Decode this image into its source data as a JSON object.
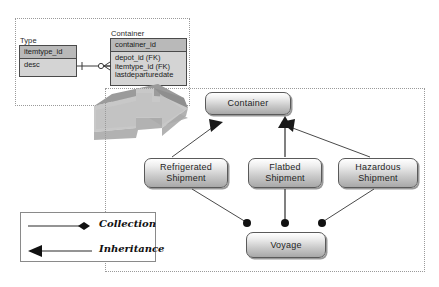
{
  "diagram": {
    "title_regions": {
      "er_region_name": "entity-relationship-region",
      "uml_region_name": "class-diagram-region"
    },
    "er": {
      "tables": [
        {
          "name": "Type",
          "caption": "Type",
          "pk": "itemtype_id",
          "attributes": [
            "desc"
          ]
        },
        {
          "name": "Container",
          "caption": "Container",
          "pk": "container_id",
          "attributes": [
            "depot_id (FK)",
            "itemtype_id (FK)",
            "lastdeparturedate"
          ]
        }
      ],
      "relationship": {
        "from": "Type",
        "to": "Container",
        "notation": "crows-foot",
        "from_cardinality": "one",
        "to_cardinality": "many-optional"
      }
    },
    "transform_arrow": {
      "label": "",
      "direction": "right",
      "style": "3d-block-arrow"
    },
    "uml": {
      "classes": [
        {
          "id": "container",
          "label": "Container"
        },
        {
          "id": "refrigerated",
          "label": "Refrigerated\nShipment",
          "line1": "Refrigerated",
          "line2": "Shipment"
        },
        {
          "id": "flatbed",
          "label": "Flatbed\nShipment",
          "line1": "Flatbed",
          "line2": "Shipment"
        },
        {
          "id": "hazardous",
          "label": "Hazardous\nShipment",
          "line1": "Hazardous",
          "line2": "Shipment"
        },
        {
          "id": "voyage",
          "label": "Voyage"
        }
      ],
      "inheritance_links": [
        {
          "from": "refrigerated",
          "to": "container"
        },
        {
          "from": "flatbed",
          "to": "container"
        },
        {
          "from": "hazardous",
          "to": "container"
        }
      ],
      "collection_links": [
        {
          "from": "refrigerated",
          "to": "voyage"
        },
        {
          "from": "flatbed",
          "to": "voyage"
        },
        {
          "from": "hazardous",
          "to": "voyage"
        }
      ]
    },
    "legend": {
      "items": [
        {
          "id": "collection",
          "label": "Collection",
          "marker": "filled-diamond"
        },
        {
          "id": "inheritance",
          "label": "Inheritance",
          "marker": "solid-triangle-arrowhead"
        }
      ]
    },
    "colors": {
      "table_header_fill": "#b9b9b9",
      "table_body_fill": "#d4d4d4",
      "table_border": "#4a4a4a",
      "region_border": "#9a9a9a",
      "class_box_border": "#5a5a5a",
      "line_color": "#3a3a3a",
      "arrow_light": "#cfcfcf",
      "arrow_mid": "#b0b0b0",
      "arrow_dark": "#8f8f8f"
    }
  }
}
